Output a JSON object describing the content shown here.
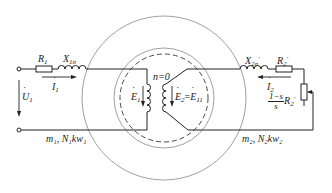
{
  "diagram": {
    "type": "induction-motor-locked-rotor-equivalent",
    "colors": {
      "line": "#222222",
      "circle": "#888888"
    },
    "stator_circuit": {
      "resistor": {
        "symbol": "R",
        "sub": "1"
      },
      "reactance": {
        "symbol": "X",
        "sub": "1σ"
      },
      "current": {
        "symbol": "I",
        "sub": "1"
      },
      "voltage": {
        "symbol": "U",
        "sub": "1"
      },
      "emf": {
        "symbol": "E",
        "sub": "1"
      },
      "winding_label": "m₁, N₁kw₁"
    },
    "rotor_circuit": {
      "reactance": {
        "symbol": "X",
        "sub": "2σ",
        "prime": "′"
      },
      "resistor": {
        "symbol": "R",
        "sub": "2",
        "prime": "′"
      },
      "current": {
        "symbol": "I",
        "sub": "2"
      },
      "emf": {
        "symbol": "E",
        "sub": "2",
        "eq": "=",
        "symbol2": "E",
        "sub2": "11"
      },
      "load": {
        "num": "1−s",
        "den": "s",
        "symbol": "R",
        "sub": "2",
        "prime": "′"
      },
      "winding_label": "m₂, N₂kw₂"
    },
    "speed_label": "n=0"
  }
}
